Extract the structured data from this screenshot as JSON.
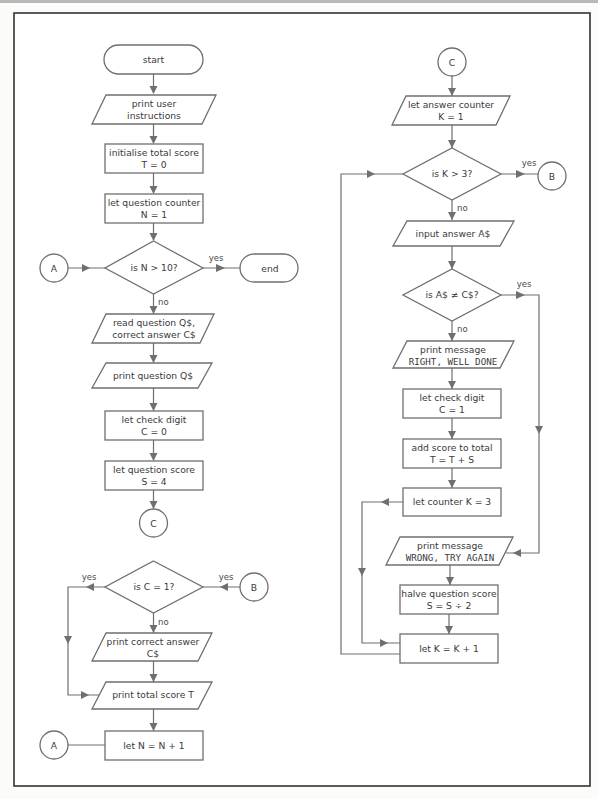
{
  "left_column": {
    "start": "start",
    "print_instructions": [
      "print user",
      "instructions"
    ],
    "init_total": [
      "initialise total score",
      "T = 0"
    ],
    "question_counter": [
      "let question counter",
      "N = 1"
    ],
    "decision_n": "is N > 10?",
    "decision_n_yes": "yes",
    "decision_n_no": "no",
    "end": "end",
    "connector_a_in": "A",
    "read_question": [
      "read question Q$,",
      "correct answer  C$"
    ],
    "print_question": "print question Q$",
    "check_digit_zero": [
      "let check digit",
      "C = 0"
    ],
    "question_score": [
      "let question score",
      "S = 4"
    ],
    "connector_c_out": "C",
    "decision_c": "is C = 1?",
    "decision_c_yes": "yes",
    "decision_c_no": "no",
    "connector_b_in": "B",
    "connector_b_yes": "yes",
    "print_correct_answer": [
      "print correct answer",
      "C$"
    ],
    "print_total": "print total score  T",
    "increment_n": "let N = N + 1",
    "connector_a_out": "A"
  },
  "right_column": {
    "connector_c_in": "C",
    "answer_counter": [
      "let answer counter",
      "K = 1"
    ],
    "decision_k": "is K > 3?",
    "decision_k_yes": "yes",
    "decision_k_no": "no",
    "connector_b_out": "B",
    "input_answer": "input answer A$",
    "decision_a": "is A$ ≠  C$?",
    "decision_a_yes": "yes",
    "decision_a_no": "no",
    "print_right": [
      "print message",
      "RIGHT, WELL DONE"
    ],
    "check_digit_one": [
      "let check digit",
      "C = 1"
    ],
    "add_score": [
      "add score to total",
      "T = T + S"
    ],
    "counter_k3": "let counter K = 3",
    "print_wrong": [
      "print message",
      "WRONG, TRY AGAIN"
    ],
    "halve_score": [
      "halve question score",
      "S = S ÷ 2"
    ],
    "increment_k": "let K = K + 1"
  },
  "colors": {
    "frame": "#333333",
    "shape_stroke": "#6f6f6f",
    "text": "#3a3a3a",
    "background": "#ffffff"
  }
}
